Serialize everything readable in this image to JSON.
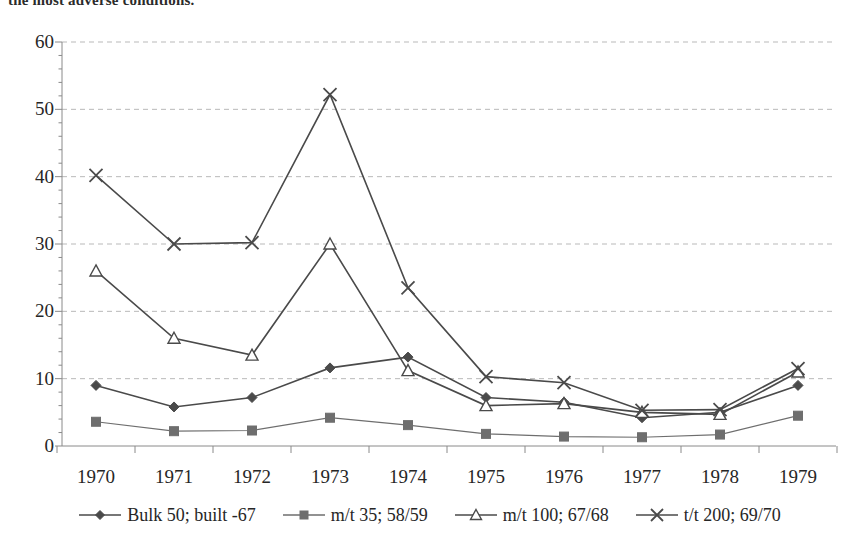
{
  "page": {
    "top_text_fragment": "the most adverse conditions."
  },
  "chart_data": {
    "type": "line",
    "title": "",
    "subtitle": "",
    "xlabel": "",
    "ylabel": "",
    "categories": [
      "1970",
      "1971",
      "1972",
      "1973",
      "1974",
      "1975",
      "1976",
      "1977",
      "1978",
      "1979"
    ],
    "ylim": [
      0,
      60
    ],
    "yticks": [
      0,
      10,
      20,
      30,
      40,
      50,
      60
    ],
    "grid": "horizontal-dashed",
    "legend_position": "bottom",
    "series": [
      {
        "name": "Bulk 50; built -67",
        "marker": "diamond",
        "color": "#4a4a4a",
        "values": [
          9.0,
          5.8,
          7.2,
          11.6,
          13.2,
          7.2,
          6.5,
          4.2,
          5.0,
          9.0
        ]
      },
      {
        "name": "m/t 35; 58/59",
        "marker": "square",
        "color": "#6e6e6e",
        "values": [
          3.6,
          2.2,
          2.3,
          4.2,
          3.1,
          1.8,
          1.4,
          1.3,
          1.7,
          4.5
        ]
      },
      {
        "name": "m/t 100; 67/68",
        "marker": "triangle",
        "color": "#4a4a4a",
        "values": [
          26.0,
          16.0,
          13.5,
          30.0,
          11.2,
          6.0,
          6.3,
          5.0,
          4.7,
          11.0
        ]
      },
      {
        "name": "t/t 200; 69/70",
        "marker": "cross-x",
        "color": "#4a4a4a",
        "values": [
          40.2,
          30.0,
          30.2,
          52.2,
          23.5,
          10.3,
          9.4,
          5.3,
          5.4,
          11.5
        ]
      }
    ]
  },
  "axis": {
    "y_tick_labels": [
      "60",
      "50",
      "40",
      "30",
      "20",
      "10",
      "0"
    ],
    "x_tick_labels": [
      "1970",
      "1971",
      "1972",
      "1973",
      "1974",
      "1975",
      "1976",
      "1977",
      "1978",
      "1979"
    ]
  },
  "legend": {
    "items": [
      {
        "label": "Bulk 50; built -67",
        "marker": "diamond"
      },
      {
        "label": "m/t 35; 58/59",
        "marker": "square"
      },
      {
        "label": "m/t 100; 67/68",
        "marker": "triangle"
      },
      {
        "label": "t/t 200; 69/70",
        "marker": "cross-x"
      }
    ]
  },
  "colors": {
    "ink": "#262626",
    "line": "#4a4a4a",
    "line_light": "#6e6e6e",
    "grid": "#b9b9b9",
    "axis": "#8a8a8a",
    "background": "#ffffff"
  }
}
